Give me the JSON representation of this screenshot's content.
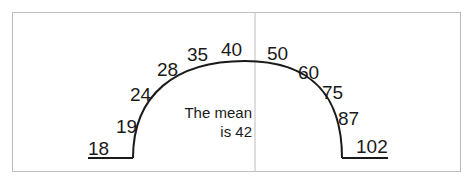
{
  "diagram": {
    "type": "semicircle-values",
    "values": [
      "18",
      "19",
      "24",
      "28",
      "35",
      "40",
      "50",
      "60",
      "75",
      "87",
      "102"
    ],
    "note_line1": "The mean",
    "note_line2": "is 42",
    "colors": {
      "stroke": "#1a1a1a",
      "frame": "#bdbdbd",
      "divider": "#c8c8c8"
    }
  }
}
